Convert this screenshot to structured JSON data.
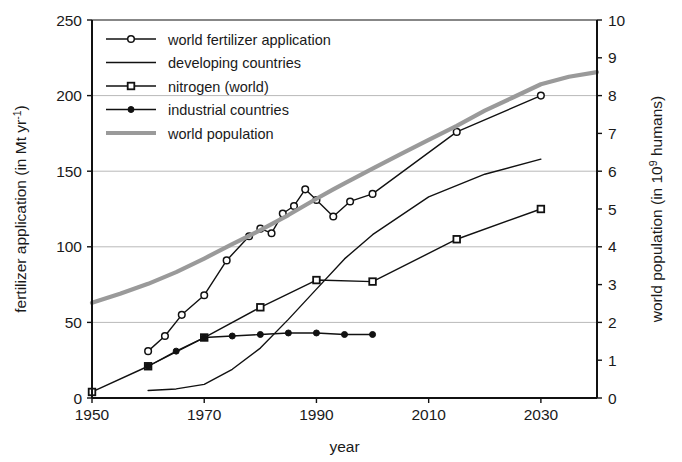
{
  "chart_data": {
    "type": "line",
    "title": "",
    "xlabel": "year",
    "ylabel": "fertilizer application (in Mt yr",
    "ylabel_sup": "-1",
    "ylabel_tail": ")",
    "y2label": "world population (in 10",
    "y2label_sup": "9",
    "y2label_tail": " humans)",
    "xlim": [
      1950,
      2040
    ],
    "ylim": [
      0,
      250
    ],
    "y2lim": [
      0,
      10
    ],
    "xticks": [
      1950,
      1970,
      1990,
      2010,
      2030
    ],
    "yticks": [
      0,
      50,
      100,
      150,
      200,
      250
    ],
    "y2ticks": [
      0,
      1,
      2,
      3,
      4,
      5,
      6,
      7,
      8,
      9,
      10
    ],
    "grid": "horizontal",
    "legend_position": "top-left",
    "series": [
      {
        "name": "world fertilizer application",
        "axis": "left",
        "color": "#111111",
        "marker": "open-circle",
        "linewidth": 1.4,
        "points": [
          [
            1960,
            31
          ],
          [
            1963,
            41
          ],
          [
            1966,
            55
          ],
          [
            1970,
            68
          ],
          [
            1974,
            91
          ],
          [
            1978,
            107
          ],
          [
            1980,
            112
          ],
          [
            1982,
            109
          ],
          [
            1984,
            122
          ],
          [
            1986,
            127
          ],
          [
            1988,
            138
          ],
          [
            1990,
            131
          ],
          [
            1993,
            120
          ],
          [
            1996,
            130
          ],
          [
            2000,
            135
          ],
          [
            2015,
            176
          ],
          [
            2030,
            200
          ]
        ]
      },
      {
        "name": "developing countries",
        "axis": "left",
        "color": "#111111",
        "marker": "none",
        "linewidth": 1.4,
        "points": [
          [
            1960,
            5
          ],
          [
            1965,
            6
          ],
          [
            1970,
            9
          ],
          [
            1975,
            19
          ],
          [
            1980,
            33
          ],
          [
            1985,
            52
          ],
          [
            1990,
            72
          ],
          [
            1995,
            92
          ],
          [
            2000,
            108
          ],
          [
            2010,
            133
          ],
          [
            2020,
            148
          ],
          [
            2030,
            158
          ]
        ]
      },
      {
        "name": "nitrogen (world)",
        "axis": "left",
        "color": "#111111",
        "marker": "open-square",
        "linewidth": 1.4,
        "points": [
          [
            1950,
            4
          ],
          [
            1960,
            21
          ],
          [
            1970,
            40
          ],
          [
            1980,
            60
          ],
          [
            1990,
            78
          ],
          [
            2000,
            77
          ],
          [
            2015,
            105
          ],
          [
            2030,
            125
          ]
        ]
      },
      {
        "name": "industrial countries",
        "axis": "left",
        "color": "#111111",
        "marker": "filled-circle",
        "linewidth": 1.4,
        "points": [
          [
            1960,
            21
          ],
          [
            1965,
            31
          ],
          [
            1970,
            40
          ],
          [
            1975,
            41
          ],
          [
            1980,
            42
          ],
          [
            1985,
            43
          ],
          [
            1990,
            43
          ],
          [
            1995,
            42
          ],
          [
            2000,
            42
          ]
        ]
      },
      {
        "name": "world population",
        "axis": "right",
        "color": "#9a9a9a",
        "marker": "none",
        "linewidth": 4.2,
        "points": [
          [
            1950,
            2.52
          ],
          [
            1955,
            2.76
          ],
          [
            1960,
            3.02
          ],
          [
            1965,
            3.33
          ],
          [
            1970,
            3.69
          ],
          [
            1975,
            4.07
          ],
          [
            1980,
            4.44
          ],
          [
            1985,
            4.84
          ],
          [
            1990,
            5.27
          ],
          [
            1993,
            5.52
          ],
          [
            1995,
            5.68
          ],
          [
            2000,
            6.07
          ],
          [
            2005,
            6.45
          ],
          [
            2010,
            6.83
          ],
          [
            2015,
            7.2
          ],
          [
            2020,
            7.6
          ],
          [
            2025,
            7.95
          ],
          [
            2030,
            8.3
          ],
          [
            2035,
            8.5
          ],
          [
            2040,
            8.62
          ]
        ]
      }
    ]
  },
  "legend": {
    "items": [
      {
        "label": "world fertilizer application",
        "marker": "open-circle",
        "color": "#111111"
      },
      {
        "label": "developing countries",
        "marker": "none",
        "color": "#111111"
      },
      {
        "label": "nitrogen (world)",
        "marker": "open-square",
        "color": "#111111"
      },
      {
        "label": "industrial countries",
        "marker": "filled-circle",
        "color": "#111111"
      },
      {
        "label": "world population",
        "marker": "none",
        "color": "#9a9a9a"
      }
    ]
  }
}
